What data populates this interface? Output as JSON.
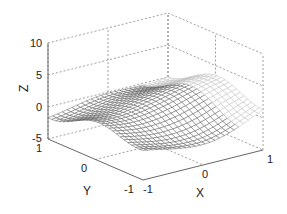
{
  "chart_data": {
    "type": "surface3d",
    "title": "",
    "xlabel": "X",
    "ylabel": "Y",
    "zlabel": "Z",
    "xlim": [
      -1,
      1
    ],
    "ylim": [
      -1,
      1
    ],
    "zlim": [
      -5,
      10
    ],
    "xticks": [
      "-1",
      "0",
      "1"
    ],
    "yticks": [
      "-1",
      "0",
      "1"
    ],
    "zticks": [
      "-5",
      "0",
      "5",
      "10"
    ],
    "grid": true,
    "mesh": {
      "resolution": 25,
      "description": "Wavy mesh surface z(x,y), ridges along y, values roughly -2 to 4, rising near x=1",
      "z_range_visible": [
        -2,
        4
      ]
    }
  },
  "colors": {
    "axis": "#666666",
    "grid": "#888888",
    "mesh": "#555555",
    "text": "#222222"
  }
}
